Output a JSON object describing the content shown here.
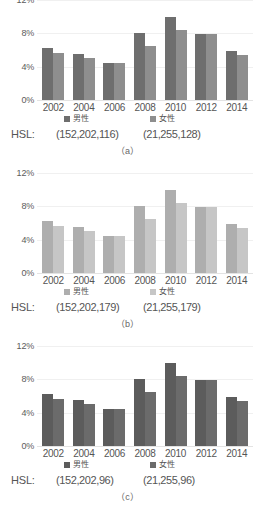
{
  "figure": {
    "panels": [
      {
        "key": "a",
        "caption": "（a）",
        "hsl_tag": "HSL:",
        "legend": [
          {
            "label": "男性",
            "hsl": "(152,202,116)",
            "color": "#6e6e6e"
          },
          {
            "label": "女性",
            "hsl": "(21,255,128)",
            "color": "#8e8e8e"
          }
        ],
        "chart_data": {
          "type": "bar",
          "title": "",
          "xlabel": "",
          "ylabel": "",
          "categories": [
            "2002",
            "2004",
            "2006",
            "2008",
            "2010",
            "2012",
            "2014"
          ],
          "series": [
            {
              "name": "男性",
              "values": [
                6.2,
                5.5,
                4.5,
                8.0,
                10.0,
                7.9,
                5.9
              ],
              "color": "#6e6e6e"
            },
            {
              "name": "女性",
              "values": [
                5.7,
                5.1,
                4.4,
                6.5,
                8.4,
                7.9,
                5.4
              ],
              "color": "#8e8e8e"
            }
          ],
          "ylim": [
            0,
            12
          ],
          "yticks": [
            "0%",
            "4%",
            "8%",
            "12%"
          ],
          "ytick_values": [
            0,
            4,
            8,
            12
          ],
          "grid": true,
          "legend_position": "bottom"
        }
      },
      {
        "key": "b",
        "caption": "（b）",
        "hsl_tag": "HSL:",
        "legend": [
          {
            "label": "男性",
            "hsl": "(152,202,179)",
            "color": "#aeaeae"
          },
          {
            "label": "女性",
            "hsl": "(21,255,179)",
            "color": "#c6c6c6"
          }
        ],
        "chart_data": {
          "type": "bar",
          "title": "",
          "xlabel": "",
          "ylabel": "",
          "categories": [
            "2002",
            "2004",
            "2006",
            "2008",
            "2010",
            "2012",
            "2014"
          ],
          "series": [
            {
              "name": "男性",
              "values": [
                6.2,
                5.5,
                4.5,
                8.0,
                10.0,
                7.9,
                5.9
              ],
              "color": "#aeaeae"
            },
            {
              "name": "女性",
              "values": [
                5.7,
                5.1,
                4.4,
                6.5,
                8.4,
                7.9,
                5.4
              ],
              "color": "#c6c6c6"
            }
          ],
          "ylim": [
            0,
            12
          ],
          "yticks": [
            "0%",
            "4%",
            "8%",
            "12%"
          ],
          "ytick_values": [
            0,
            4,
            8,
            12
          ],
          "grid": true,
          "legend_position": "bottom"
        }
      },
      {
        "key": "c",
        "caption": "（c）",
        "hsl_tag": "HSL:",
        "legend": [
          {
            "label": "男性",
            "hsl": "(152,202,96)",
            "color": "#5c5c5c"
          },
          {
            "label": "女性",
            "hsl": "(21,255,96)",
            "color": "#6b6b6b"
          }
        ],
        "chart_data": {
          "type": "bar",
          "title": "",
          "xlabel": "",
          "ylabel": "",
          "categories": [
            "2002",
            "2004",
            "2006",
            "2008",
            "2010",
            "2012",
            "2014"
          ],
          "series": [
            {
              "name": "男性",
              "values": [
                6.2,
                5.5,
                4.5,
                8.0,
                10.0,
                7.9,
                5.9
              ],
              "color": "#5c5c5c"
            },
            {
              "name": "女性",
              "values": [
                5.7,
                5.1,
                4.4,
                6.5,
                8.4,
                7.9,
                5.4
              ],
              "color": "#6b6b6b"
            }
          ],
          "ylim": [
            0,
            12
          ],
          "yticks": [
            "0%",
            "4%",
            "8%",
            "12%"
          ],
          "ytick_values": [
            0,
            4,
            8,
            12
          ],
          "grid": true,
          "legend_position": "bottom"
        }
      }
    ]
  }
}
